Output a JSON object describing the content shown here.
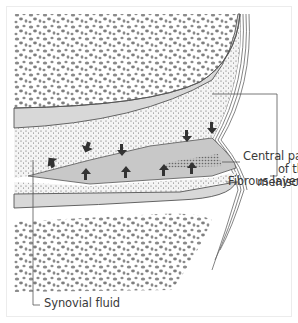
{
  "diagram": {
    "labels": {
      "central_line1": "Central part",
      "central_line2": "of the",
      "central_line3": "meniscus",
      "fibrous": "Fibrous layer",
      "synovial": "Synovial fluid"
    },
    "structures": [
      "femoral-condyle-cancellous-bone",
      "femoral-articular-cartilage",
      "synovial-fluid-space",
      "meniscus-wedge",
      "tibial-articular-cartilage",
      "tibial-cancellous-bone",
      "joint-capsule-fibrous-layer"
    ],
    "arrows": {
      "count": 8,
      "meaning": "diffusion of synovial fluid into meniscus"
    },
    "colors": {
      "bone_speckle": "#8a8a8a",
      "cartilage": "#d6d6d6",
      "meniscus": "#c8c8c8",
      "synovial_dots": "#6a6a6a",
      "line": "#555555",
      "label_text": "#3a3a3a"
    }
  }
}
